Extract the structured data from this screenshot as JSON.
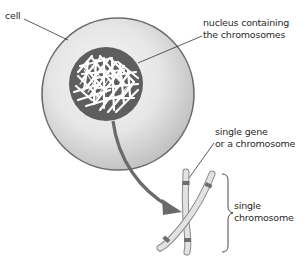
{
  "labels": {
    "cell": "cell",
    "nucleus_line1": "nucleus containing",
    "nucleus_line2": "the chromosomes",
    "gene_line1": "single gene",
    "gene_line2": "or a chromosome",
    "chromosome_line1": "single",
    "chromosome_line2": "chromosome"
  },
  "colors": {
    "background": "#ffffff",
    "cell_fill_light": "#f2f2f2",
    "cell_fill_dark": "#bdbdbd",
    "cell_outline": "#6b6b6b",
    "nucleus_fill": "#5e5e5e",
    "chromatin": "#ffffff",
    "arrow": "#6a6a6a",
    "chromosome_fill": "#dcdcdc",
    "chromosome_outline": "#8a8a8a",
    "gene_band": "#6e6e6e",
    "leader_line": "#333333",
    "text": "#2a2a2a"
  }
}
